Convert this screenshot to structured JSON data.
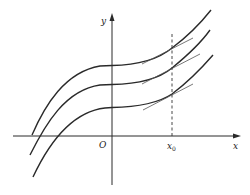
{
  "diagram": {
    "labels": {
      "y_axis": "y",
      "x_axis": "x",
      "origin": "O",
      "x0_main": "x",
      "x0_sub": "0"
    },
    "colors": {
      "curve": "#2a2a2a",
      "axis": "#2a2a2a",
      "tangent": "#555555",
      "dashed": "#333333",
      "background": "#ffffff"
    },
    "curves": [
      {
        "name": "upper-curve",
        "path": "M32,135 C45,105 65,72 100,66 L112,65.5 C140,65 160,58 172,48 C188,36 200,24 211,10"
      },
      {
        "name": "middle-curve",
        "path": "M30,155 C45,125 65,90 100,85 L112,84.5 C140,84 160,78 172,68 C188,55 200,44 210,30"
      },
      {
        "name": "lower-curve",
        "path": "M33,177 C48,145 70,112 105,108 L112,107.5 C140,107 160,102 172,94 C188,82 200,70 213,55"
      }
    ],
    "tangents": [
      {
        "name": "upper-tangent",
        "x1": 142,
        "y1": 64,
        "x2": 193,
        "y2": 38
      },
      {
        "name": "middle-tangent",
        "x1": 142,
        "y1": 84,
        "x2": 200,
        "y2": 54
      },
      {
        "name": "lower-tangent",
        "x1": 143,
        "y1": 110,
        "x2": 193,
        "y2": 84
      }
    ]
  }
}
